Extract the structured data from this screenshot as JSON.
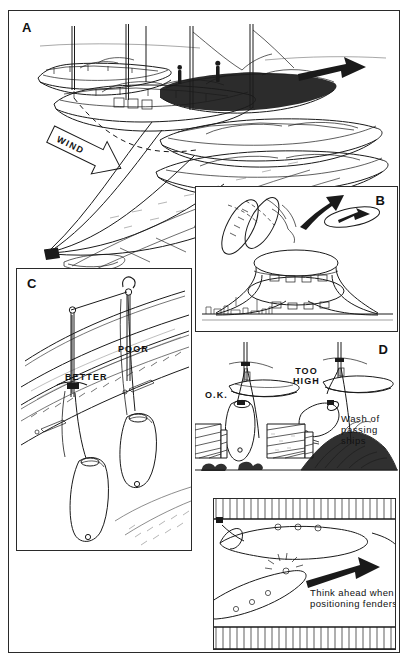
{
  "figure": {
    "medium": "pen-and-ink line illustration",
    "ink_color": "#1a1a1a",
    "paper_color": "#ffffff"
  },
  "panels": [
    {
      "letter": "A",
      "name": "panel-a",
      "caption": "Yachts rafted alongside a quay with mooring lines led ashore",
      "labels": [
        {
          "text": "WIND",
          "kind": "banner-arrow",
          "direction": "down-right"
        }
      ],
      "elements": [
        "moored sailing yachts rafted side by side",
        "crew figures aboard the dark-hulled yacht",
        "bow and stern shore lines converging on a quayside bollard",
        "heavy black arrow indicating direction of approach",
        "stone-paved quay"
      ]
    },
    {
      "letter": "B",
      "name": "panel-b",
      "caption": "Plan view of boats rafted up, showing lines taken ashore",
      "labels": [
        {
          "text": "WIND",
          "kind": "banner-arrow",
          "direction": "left"
        }
      ],
      "elements": [
        "plan outlines of rafted hulls with fenders between them",
        "curved black arrow showing swing of the outer boat",
        "small hull plan with arrow showing heading",
        "shoreline with distant buildings"
      ]
    },
    {
      "letter": "C",
      "name": "panel-c",
      "caption": "Two fenders hung from a guardrail, one correctly and one poorly secured",
      "labels": [
        {
          "text": "BETTER",
          "kind": "callout"
        },
        {
          "text": "POOR",
          "kind": "callout"
        }
      ],
      "elements": [
        "topsides and rubbing strake of a yacht",
        "fender tied to the toe rail or stanchion base",
        "fender tied to the guardrail wire"
      ]
    },
    {
      "letter": "D",
      "name": "panel-d",
      "caption": "Fender height against a quay wall, and thinking ahead when positioning fenders",
      "labels": [
        {
          "text": "O.K.",
          "kind": "callout"
        },
        {
          "text": "TOO\nHIGH",
          "kind": "callout"
        },
        {
          "text": "Wash of\npassing\nships",
          "kind": "note"
        },
        {
          "text": "Think ahead when\npositioning fenders",
          "kind": "note"
        }
      ],
      "elements": [
        "fender correctly placed against the quay face",
        "fender riding up above the quay edge",
        "wash from passing ships lifting the boat",
        "plan view of a boat alongside a pontoon with fenders placed",
        "black arrow pointing to the repositioned boat"
      ]
    }
  ]
}
